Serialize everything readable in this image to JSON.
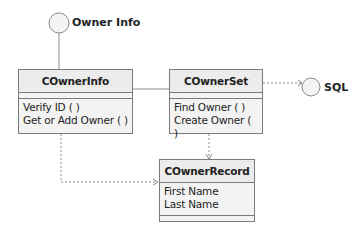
{
  "interfaces": [
    {
      "id": "owner-info",
      "label": "Owner Info"
    },
    {
      "id": "sql",
      "label": "SQL"
    }
  ],
  "classes": [
    {
      "id": "cownerinfo",
      "name": "COwnerInfo",
      "operations": [
        "Verify ID ( )",
        "Get or Add Owner ( )"
      ],
      "attributes": []
    },
    {
      "id": "cownerset",
      "name": "COwnerSet",
      "operations": [
        "Find Owner ( )",
        "Create Owner ( )"
      ],
      "attributes": []
    },
    {
      "id": "cownerrecord",
      "name": "COwnerRecord",
      "attributes": [
        "First Name",
        "Last Name"
      ],
      "operations": []
    }
  ],
  "relations": [
    {
      "from": "Owner Info",
      "to": "COwnerInfo",
      "type": "interface-lollipop"
    },
    {
      "from": "COwnerInfo",
      "to": "COwnerSet",
      "type": "association"
    },
    {
      "from": "COwnerSet",
      "to": "SQL",
      "type": "dependency"
    },
    {
      "from": "COwnerSet",
      "to": "COwnerRecord",
      "type": "dependency"
    },
    {
      "from": "COwnerInfo",
      "to": "COwnerRecord",
      "type": "dependency"
    }
  ],
  "colors": {
    "line": "#7a7a7a",
    "box_fill": "#f3f3f3",
    "text": "#222222"
  }
}
